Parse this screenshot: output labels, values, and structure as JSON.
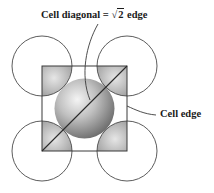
{
  "figure": {
    "labels": {
      "diagonal": {
        "prefix": "Cell diagonal = ",
        "radical": "√",
        "radicand": "2",
        "suffix": " edge"
      },
      "edge": "Cell edge"
    },
    "colors": {
      "line": "#3a3a3a",
      "sphere_dark": "#6e6e6e",
      "sphere_mid": "#a8a8a8",
      "sphere_light": "#f2f2f2"
    },
    "cell": {
      "x": 42,
      "y": 66,
      "size": 85
    },
    "corner_atom_radius": 30,
    "center_atom": {
      "cx": 84.5,
      "cy": 108.5,
      "r": 30
    }
  }
}
